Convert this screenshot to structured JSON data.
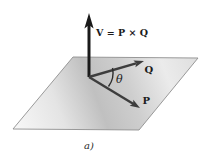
{
  "diagram": {
    "caption": "a)",
    "labels": {
      "v": "V = P × Q",
      "q": "Q",
      "p": "P",
      "theta": "θ"
    },
    "colors": {
      "background": "#ffffff",
      "v_arrow": "#1a1a1a",
      "pq_arrow": "#3d3d3d",
      "theta_arc": "#2e2e2e",
      "text": "#1c1c1c",
      "plane_edge": "#8f8f8f",
      "plane_stop_a": "#f8f8f8",
      "plane_stop_b": "#e4e4e4",
      "plane_stop_c": "#c0c0c0",
      "plane_stop_d": "#cecece",
      "plane_stop_e": "#ebebeb",
      "plane_stop_f": "#dedede"
    }
  }
}
